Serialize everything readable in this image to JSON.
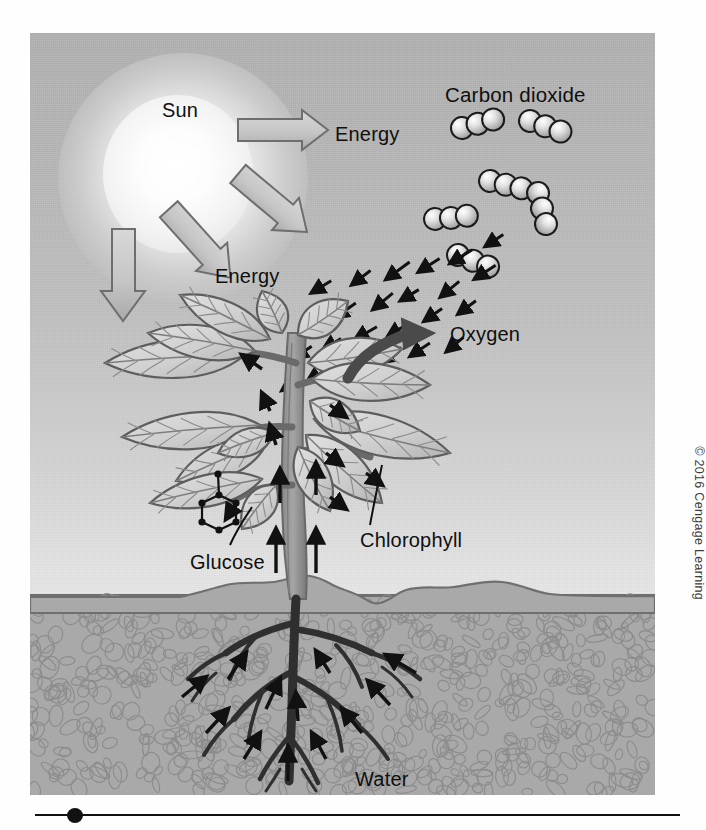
{
  "figure": {
    "sun": {
      "label": "Sun"
    },
    "labels": {
      "energy_top": "Energy",
      "energy_lower": "Energy",
      "carbon_dioxide": "Carbon dioxide",
      "oxygen": "Oxygen",
      "chlorophyll": "Chlorophyll",
      "glucose": "Glucose",
      "water": "Water"
    },
    "credit": "© 2016 Cengage Learning",
    "colors": {
      "sky_top": "#b2b2b2",
      "sky_bottom": "#f2f2f2",
      "soil": "#a9a9a9",
      "soil_outline": "#6f6f6f",
      "leaf_fill": "#d6d6d6",
      "leaf_outline": "#5d5d5d",
      "stem": "#8f8f8f",
      "root": "#3a3a3a",
      "arrow_outline": "#6b6b6b",
      "arrow_fill": "#c9c9c9",
      "text": "#0f0f0f",
      "rule": "#111111"
    },
    "counts": {
      "energy_block_arrows": 4,
      "co2_molecules": 6,
      "atoms_per_co2_molecule": 3,
      "gas_exchange_arrows": 24,
      "root_uptake_arrows": 18
    }
  }
}
